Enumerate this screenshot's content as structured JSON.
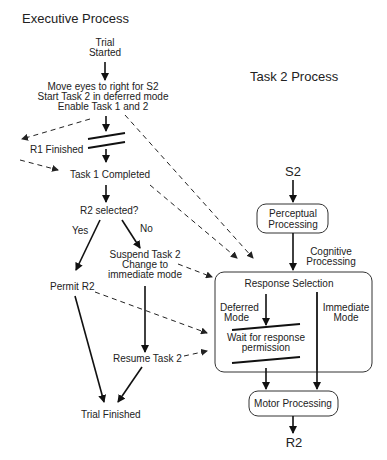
{
  "executive": {
    "title": "Executive Process",
    "trial_started": [
      "Trial",
      "Started"
    ],
    "move_eyes": [
      "Move eyes to right for S2",
      "Start Task 2 in deferred  mode",
      "Enable Task 1 and  2"
    ],
    "r1_finished": "R1 Finished",
    "task1_completed": "Task 1 Completed",
    "r2_selected": "R2 selected?",
    "yes": "Yes",
    "no": "No",
    "suspend": [
      "Suspend Task 2",
      "Change to",
      "immediate  mode"
    ],
    "permit": "Permit R2",
    "resume": "Resume Task 2",
    "trial_finished": "Trial Finished"
  },
  "task2": {
    "title": "Task 2 Process",
    "s2": "S2",
    "perceptual": [
      "Perceptual",
      "Processing"
    ],
    "cognitive": [
      "Cognitive",
      "Processing"
    ],
    "response_selection": "Response Selection",
    "deferred": [
      "Deferred",
      "Mode"
    ],
    "immediate": [
      "Immediate",
      "Mode"
    ],
    "wait": [
      "Wait for response",
      "permission"
    ],
    "motor": "Motor Processing",
    "r2": "R2"
  }
}
